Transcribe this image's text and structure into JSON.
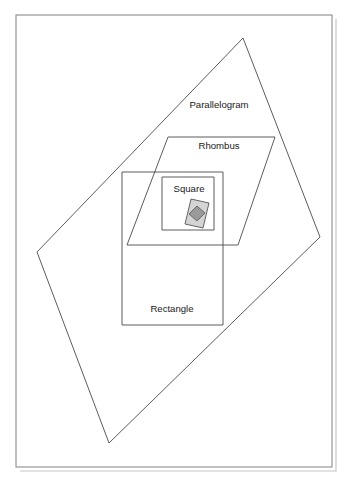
{
  "diagram": {
    "background_color": "#ffffff",
    "outline_color": "#4a4a4a",
    "frame_color": "#8a8a8a",
    "shadow_color": "#c6c6c6",
    "label_color": "#1a1a1a",
    "frame": {
      "name": "page-frame",
      "x": 16,
      "y": 15,
      "width": 316,
      "height": 452
    },
    "shapes": [
      {
        "id": "parallelogram",
        "label": "Parallelogram",
        "label_x": 219,
        "label_y": 105,
        "points": "243,38 320,237 109,443 37,252",
        "fill": "none",
        "stroke": "#4a4a4a"
      },
      {
        "id": "rhombus",
        "label": "Rhombus",
        "label_x": 219,
        "label_y": 146,
        "points": "168,137 275,137 238,245 127,245",
        "fill": "none",
        "stroke": "#4a4a4a"
      },
      {
        "id": "rectangle",
        "label": "Rectangle",
        "label_x": 172,
        "label_y": 309,
        "points": "122,172 223,172 223,325 122,325",
        "fill": "none",
        "stroke": "#4a4a4a"
      },
      {
        "id": "square",
        "label": "Square",
        "label_x": 189,
        "label_y": 189,
        "points": "162,177 214,177 214,230 162,230",
        "fill": "none",
        "stroke": "#4a4a4a"
      }
    ],
    "square_icon": {
      "name": "square-card-icon",
      "card_points": "191,199 209,203 203,228 185,224",
      "card_fill": "#d4d4d4",
      "card_stroke": "#555555",
      "diamond_points": "197,206 205,213 197,221 189,214",
      "diamond_fill": "#9a9a9a",
      "diamond_stroke": "#555555"
    }
  }
}
